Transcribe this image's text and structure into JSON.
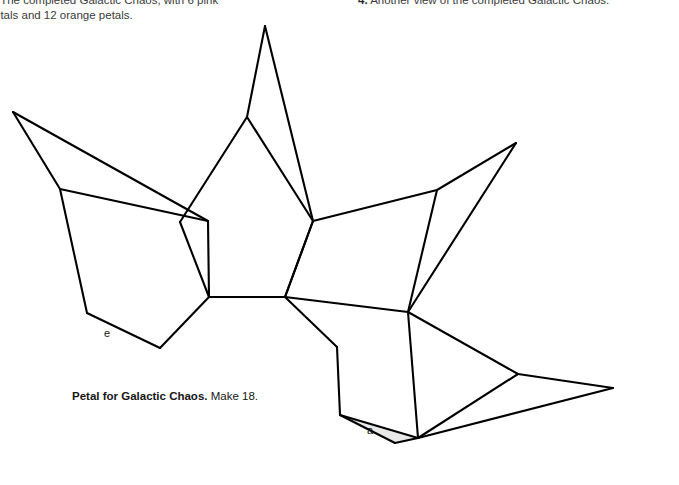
{
  "captions": {
    "left": ". The completed Galactic Chaos, with 6 pink\netals and 12 orange petals.",
    "right_number": "4.",
    "right_text": " Another view of the completed Galactic Chaos."
  },
  "petal_caption": {
    "bold": "Petal for Galactic Chaos.",
    "rest": " Make 18."
  },
  "labels": {
    "e": "e",
    "a": "a"
  },
  "colors": {
    "stroke": "#000000",
    "shade_fill": "#e8e8e8",
    "background": "#ffffff",
    "caption_text": "#3b3b3b"
  },
  "figure": {
    "type": "line-diagram",
    "viewbox": "0 0 679 485",
    "stroke_width": 2.1,
    "shaded_polygon": {
      "name": "petal-a-shaded-face",
      "fill": "#e8e8e8",
      "points": "337,347 340,415 395,443 418,438 341,416"
    },
    "paths": [
      {
        "name": "left-petal-spike-upper",
        "d": "M 13 112 L 60 189"
      },
      {
        "name": "left-petal-spike-lower",
        "d": "M 13 112 L 208 221"
      },
      {
        "name": "left-petal-inner-fold",
        "d": "M 60 189 L 208 221"
      },
      {
        "name": "left-petal-left-edge",
        "d": "M 60 189 L 87 313"
      },
      {
        "name": "left-petal-bottom-left",
        "d": "M 87 313 L 160 348"
      },
      {
        "name": "left-petal-bottom-right",
        "d": "M 160 348 L 209 297"
      },
      {
        "name": "left-petal-right-edge",
        "d": "M 208 221 L 209 297"
      },
      {
        "name": "center-petal-spike-left",
        "d": "M 265 26 L 247 117"
      },
      {
        "name": "center-petal-spike-right",
        "d": "M 265 26 L 313 221"
      },
      {
        "name": "center-petal-fold-left",
        "d": "M 247 117 L 180 222"
      },
      {
        "name": "center-petal-fold-right",
        "d": "M 247 117 L 313 221"
      },
      {
        "name": "center-petal-left-edge",
        "d": "M 180 222 L 209 297"
      },
      {
        "name": "center-petal-bottom",
        "d": "M 209 297 L 285 297"
      },
      {
        "name": "center-petal-right-edge",
        "d": "M 285 297 L 313 221"
      },
      {
        "name": "right-petal-spike-upper",
        "d": "M 516 143 L 437 190"
      },
      {
        "name": "right-petal-spike-lower",
        "d": "M 516 143 L 408 312"
      },
      {
        "name": "right-petal-fold",
        "d": "M 437 190 L 408 312"
      },
      {
        "name": "right-petal-top-edge",
        "d": "M 437 190 L 313 221"
      },
      {
        "name": "right-petal-left-edge",
        "d": "M 313 221 L 285 297"
      },
      {
        "name": "right-petal-bottom-edge",
        "d": "M 285 297 L 408 312"
      },
      {
        "name": "lower-center-petal-upper-left",
        "d": "M 285 297 L 337 347"
      },
      {
        "name": "lower-center-petal-left-edge",
        "d": "M 337 347 L 340 415"
      },
      {
        "name": "lower-center-petal-bottom-left",
        "d": "M 340 415 L 395 443"
      },
      {
        "name": "lower-center-petal-bottom-right",
        "d": "M 395 443 L 418 438"
      },
      {
        "name": "lower-center-petal-shade-fold",
        "d": "M 340 415 L 418 438"
      },
      {
        "name": "lower-center-petal-right-edge",
        "d": "M 418 438 L 408 312"
      },
      {
        "name": "lower-right-petal-upper",
        "d": "M 408 312 L 518 374"
      },
      {
        "name": "lower-right-petal-tip-upper",
        "d": "M 518 374 L 613 388"
      },
      {
        "name": "lower-right-petal-tip-lower",
        "d": "M 613 388 L 418 438"
      },
      {
        "name": "lower-right-petal-fold",
        "d": "M 518 374 L 418 438"
      }
    ]
  }
}
